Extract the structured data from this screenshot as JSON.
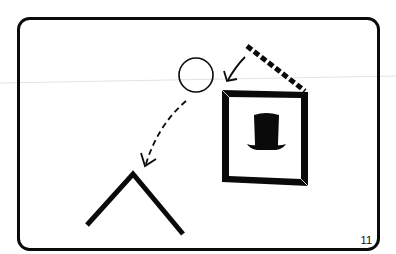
{
  "diagram": {
    "page_number": "11",
    "colors": {
      "ink": "#0a0a0a",
      "background": "#ffffff",
      "scan_line": "#d8d8d8"
    },
    "elements": {
      "panel": {
        "shape": "rounded-rectangle",
        "x": 17,
        "y": 17,
        "width": 362,
        "height": 233,
        "radius": 11,
        "stroke_width": 3
      },
      "circle": {
        "shape": "circle",
        "cx": 196,
        "cy": 75,
        "r": 17,
        "stroke_width": 1.5
      },
      "dashed_roof_line": {
        "shape": "dashed-line",
        "x1": 246,
        "y1": 45,
        "x2": 306,
        "y2": 92,
        "stroke_width": 5
      },
      "arrow_to_circle": {
        "shape": "arrow",
        "from": [
          245,
          57
        ],
        "to": [
          226,
          81
        ]
      },
      "dashed_curve_arrow": {
        "shape": "dashed-curved-arrow",
        "from": [
          186,
          101
        ],
        "to": [
          144,
          166
        ]
      },
      "picture_frame": {
        "shape": "beveled-frame",
        "x": 222,
        "y": 90,
        "width": 86,
        "height": 96,
        "stroke_width": 6
      },
      "top_hat_icon": {
        "shape": "top-hat",
        "cx": 266,
        "cy": 130
      },
      "chevron": {
        "shape": "inverted-v",
        "points": [
          [
            87,
            225
          ],
          [
            133,
            172
          ],
          [
            183,
            234
          ]
        ],
        "stroke_width": 5
      }
    }
  }
}
